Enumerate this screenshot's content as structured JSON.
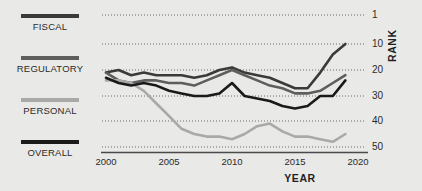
{
  "legend": {
    "items": [
      {
        "label": "FISCAL",
        "color": "#3a3a3a"
      },
      {
        "label": "REGULATORY",
        "color": "#5e5e5e"
      },
      {
        "label": "PERSONAL",
        "color": "#a9a9a9"
      },
      {
        "label": "OVERALL",
        "color": "#1a1a1a"
      }
    ]
  },
  "axes": {
    "x_title": "YEAR",
    "y_title": "RANK",
    "x_ticks": [
      "2000",
      "2005",
      "2010",
      "2015",
      "2020"
    ],
    "y_ticks": [
      "1",
      "10",
      "20",
      "30",
      "40",
      "50"
    ]
  },
  "chart_data": {
    "type": "line",
    "title": "",
    "xlabel": "YEAR",
    "ylabel": "RANK",
    "xlim": [
      2000,
      2020
    ],
    "ylim": [
      1,
      50
    ],
    "y_inverted": true,
    "grid": "horizontal-dotted",
    "legend_position": "left",
    "x": [
      2000,
      2001,
      2002,
      2003,
      2004,
      2005,
      2006,
      2007,
      2008,
      2009,
      2010,
      2011,
      2012,
      2013,
      2014,
      2015,
      2016,
      2017,
      2018,
      2019
    ],
    "series": [
      {
        "name": "FISCAL",
        "color": "#3a3a3a",
        "values": [
          21,
          20,
          22,
          21,
          22,
          22,
          22,
          23,
          22,
          20,
          19,
          21,
          22,
          23,
          25,
          27,
          27,
          21,
          14,
          10
        ]
      },
      {
        "name": "REGULATORY",
        "color": "#5e5e5e",
        "values": [
          21,
          24,
          25,
          24,
          24,
          25,
          25,
          26,
          24,
          22,
          20,
          22,
          24,
          26,
          27,
          29,
          29,
          28,
          25,
          22
        ]
      },
      {
        "name": "PERSONAL",
        "color": "#a9a9a9",
        "values": [
          24,
          24,
          25,
          28,
          33,
          38,
          43,
          45,
          46,
          46,
          47,
          45,
          42,
          41,
          44,
          46,
          46,
          47,
          48,
          45
        ]
      },
      {
        "name": "OVERALL",
        "color": "#1a1a1a",
        "values": [
          23,
          25,
          26,
          25,
          26,
          28,
          29,
          30,
          30,
          29,
          25,
          30,
          31,
          32,
          34,
          35,
          34,
          30,
          30,
          24
        ]
      }
    ]
  }
}
